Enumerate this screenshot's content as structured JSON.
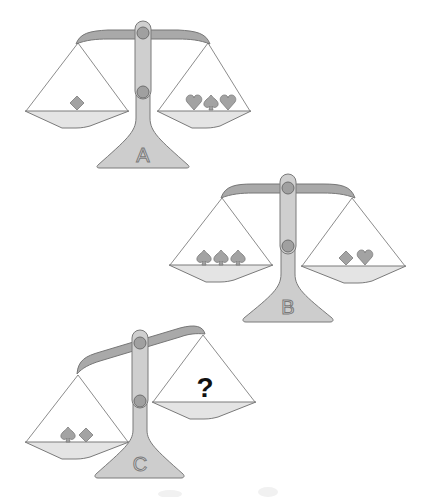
{
  "puzzle": {
    "type": "balance-scale-puzzle",
    "colors": {
      "beam": "#a9a9a9",
      "post": "#cfcfcf",
      "pan": "#e4e4e4",
      "suit": "#a3a3a3",
      "question": "#111111"
    },
    "scales": [
      {
        "label": "A",
        "state": "balanced",
        "left_pan": [
          "diamond"
        ],
        "right_pan": [
          "heart",
          "spade",
          "heart"
        ]
      },
      {
        "label": "B",
        "state": "balanced",
        "left_pan": [
          "spade",
          "spade",
          "spade"
        ],
        "right_pan": [
          "diamond",
          "heart"
        ]
      },
      {
        "label": "C",
        "state": "tilted-left-down",
        "left_pan": [
          "spade",
          "diamond"
        ],
        "right_pan": [
          "?"
        ]
      }
    ],
    "question_mark": "?"
  }
}
